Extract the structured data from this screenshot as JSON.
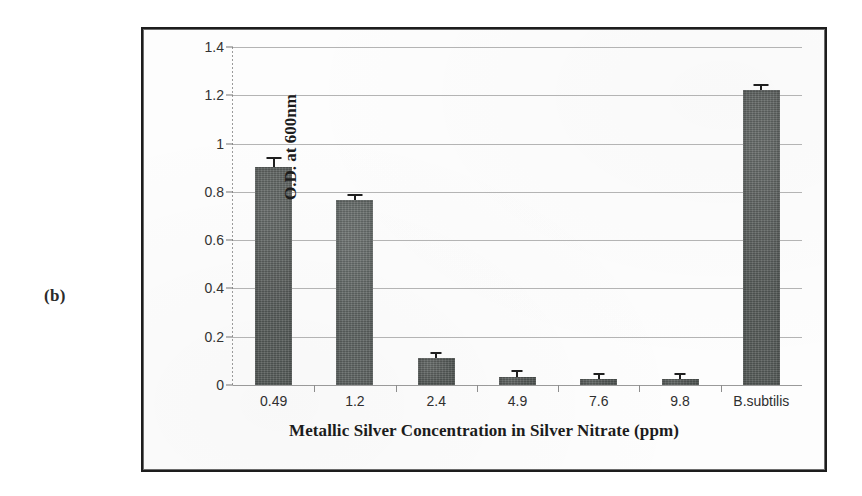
{
  "figure": {
    "panel_label": "(b)"
  },
  "chart_data": {
    "type": "bar",
    "title": "",
    "xlabel": "Metallic Silver Concentration in Silver Nitrate (ppm)",
    "ylabel": "O.D. at 600nm",
    "categories": [
      "0.49",
      "1.2",
      "2.4",
      "4.9",
      "7.6",
      "9.8",
      "B.subtilis"
    ],
    "values": [
      0.905,
      0.765,
      0.11,
      0.035,
      0.025,
      0.025,
      1.22
    ],
    "errors": [
      0.018,
      0.012,
      0.006,
      0.012,
      0.007,
      0.008,
      0.01
    ],
    "ylim": [
      0,
      1.4
    ],
    "ytick_labels": [
      "0",
      "0.2",
      "0.4",
      "0.6",
      "0.8",
      "1",
      "1.2",
      "1.4"
    ],
    "ytick_values": [
      0,
      0.2,
      0.4,
      0.6,
      0.8,
      1,
      1.2,
      1.4
    ],
    "grid": true,
    "legend": "none",
    "bar_color": "#565b59",
    "error_bar_color": "#1f1f1f",
    "gridline_color": "#b4b4b4",
    "frame_color": "#1d1d1d"
  }
}
